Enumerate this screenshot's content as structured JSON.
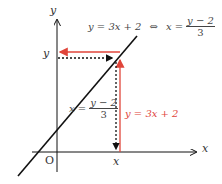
{
  "axes": {
    "x_label": "x",
    "y_label": "y",
    "origin_label": "O"
  },
  "top_equation": {
    "left": "y = 3x + 2",
    "equiv": "⇔",
    "right_lhs": "x =",
    "right_num": "y − 2",
    "right_den": "3"
  },
  "point_labels": {
    "y_tick": "y",
    "x_tick": "x"
  },
  "inverse_equation": {
    "lhs": "x =",
    "num": "y − 2",
    "den": "3"
  },
  "forward_equation": {
    "text": "y = 3x + 2"
  },
  "colors": {
    "red": "#e0453a",
    "black": "#111111"
  }
}
